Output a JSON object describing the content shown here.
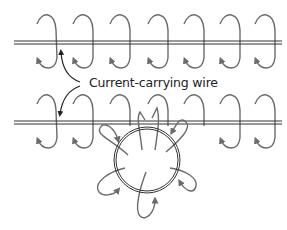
{
  "diagram": {
    "label": "Current-carrying wire",
    "colors": {
      "wire": "#333333",
      "field": "#6b6b6b",
      "text": "#222222",
      "background": "#ffffff"
    },
    "wires": [
      {
        "name": "upper-straight-wire",
        "y": 42,
        "x1": 14,
        "x2": 282
      },
      {
        "name": "lower-straight-wire",
        "y": 122,
        "x1": 14,
        "x2": 282
      }
    ],
    "field_loops_per_wire": 7,
    "loop_x_positions": [
      48,
      85,
      123,
      160,
      197,
      232,
      268
    ],
    "circular_loop": {
      "cx": 147,
      "cy": 160,
      "r": 31,
      "field_lobes": 6
    }
  }
}
